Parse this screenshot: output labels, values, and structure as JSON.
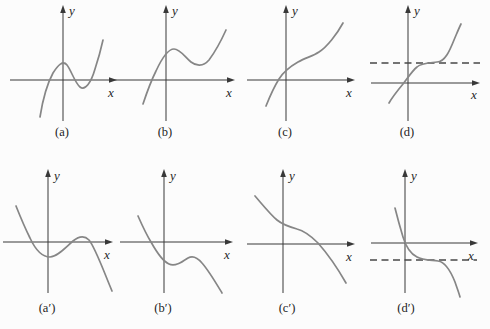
{
  "figure": {
    "background": "#fcfcfc",
    "curve_color": "#868686",
    "axis_color": "#383838",
    "dash_color": "#474747",
    "text_color": "#1f1f1f",
    "rows": 2,
    "cols": 4
  },
  "chart_data": [
    {
      "id": "a",
      "type": "line",
      "caption": "(a)",
      "xlabel": "x",
      "ylabel": "y",
      "features": "Cubic-shaped curve rising from lower left, crossing the x-axis left of the origin, with a local maximum above the x-axis just left of the y-axis and a local minimum below the x-axis right of the y-axis, then rising steeply.",
      "axes": {
        "x_axis_y": 80,
        "x_start": 10,
        "x_end": 117,
        "y_axis_x": 63,
        "y_top": 5,
        "y_bottom": 121
      },
      "curve_path": "M 40 117 C 43 98 47 84 53 73 C 58 65 63 60 67 65 C 71 70 75 83 80 87 C 85 91 91 83 95 69 C 98 60 101 49 103 40",
      "dashed_line": null,
      "labels": {
        "x_pos": [
          111,
          97
        ],
        "y_pos": [
          72,
          15
        ],
        "caption_pos": [
          62,
          136
        ]
      }
    },
    {
      "id": "b",
      "type": "line",
      "caption": "(b)",
      "xlabel": "x",
      "ylabel": "y",
      "features": "Cubic-shaped curve shifted upward: rises from lower left crossing the x-axis once left of the origin; both the local maximum and local minimum lie above the x-axis, then the curve rises steeply.",
      "axes": {
        "x_axis_y": 80,
        "x_start": 113,
        "x_end": 235,
        "y_axis_x": 166,
        "y_top": 5,
        "y_bottom": 121
      },
      "curve_path": "M 143 104 C 147 92 151 81 156 71 C 162 58 168 49 174 49 C 180 49 185 57 191 62 C 196 66 203 67 209 60 C 215 52 221 41 226 30",
      "dashed_line": null,
      "labels": {
        "x_pos": [
          229,
          97
        ],
        "y_pos": [
          175,
          15
        ],
        "caption_pos": [
          165,
          136
        ]
      }
    },
    {
      "id": "c",
      "type": "line",
      "caption": "(c)",
      "xlabel": "x",
      "ylabel": "y",
      "features": "Monotonically increasing S-shaped curve crossing the x-axis just left of the origin, flattening (inflection) above the x-axis to the right of the y-axis, then rising steeply.",
      "axes": {
        "x_axis_y": 80,
        "x_start": 247,
        "x_end": 355,
        "y_axis_x": 286,
        "y_top": 5,
        "y_bottom": 121
      },
      "curve_path": "M 266 106 C 270 96 274 87 279 79 C 284 71 291 66 298 62 C 305 58 313 56 319 52 C 327 47 337 34 343 23",
      "dashed_line": null,
      "labels": {
        "x_pos": [
          349,
          97
        ],
        "y_pos": [
          295,
          15
        ],
        "caption_pos": [
          285,
          136
        ]
      }
    },
    {
      "id": "d",
      "type": "line",
      "caption": "(d)",
      "xlabel": "x",
      "ylabel": "y",
      "features": "Increasing curve passing through the origin, leveling off along a horizontal dashed line above the x-axis, then rising steeply above it.",
      "axes": {
        "x_axis_y": 83,
        "x_start": 371,
        "x_end": 480,
        "y_axis_x": 408,
        "y_top": 5,
        "y_bottom": 121
      },
      "curve_path": "M 389 103 C 393 96 398 90 403 84 C 407 79 412 71 417 67 C 421 63 429 63 437 62 C 445 62 450 50 454 40 C 457 33 459 28 461 24",
      "dashed_line": {
        "y": 63,
        "x_start": 370,
        "x_end": 480
      },
      "labels": {
        "x_pos": [
          474,
          99
        ],
        "y_pos": [
          417,
          15
        ],
        "caption_pos": [
          407,
          136
        ]
      }
    },
    {
      "id": "a-prime",
      "type": "line",
      "caption": "(a′)",
      "xlabel": "x",
      "ylabel": "y",
      "features": "Mirror of (a): falls from upper left crossing the x-axis left of the origin, local minimum below the x-axis near the y-axis, local maximum slightly above the x-axis right of the y-axis, then falls steeply.",
      "axes": {
        "x_axis_y": 242,
        "x_start": 3,
        "x_end": 113,
        "y_axis_x": 48,
        "y_top": 169,
        "y_bottom": 293
      },
      "curve_path": "M 16 206 C 20 216 25 228 30 238 C 36 251 43 257 50 257 C 57 257 65 248 73 241 C 78 237 84 235 89 240 C 95 247 104 272 112 291",
      "dashed_line": null,
      "labels": {
        "x_pos": [
          107,
          259
        ],
        "y_pos": [
          57,
          180
        ],
        "caption_pos": [
          47,
          312
        ]
      }
    },
    {
      "id": "b-prime",
      "type": "line",
      "caption": "(b′)",
      "xlabel": "x",
      "ylabel": "y",
      "features": "Mirror of (b): falls from upper left crossing the x-axis once left of the origin; both the local minimum and local maximum lie below the x-axis, then the curve falls steeply.",
      "axes": {
        "x_axis_y": 242,
        "x_start": 120,
        "x_end": 233,
        "y_axis_x": 164,
        "y_top": 169,
        "y_bottom": 293
      },
      "curve_path": "M 138 216 C 142 225 146 234 151 242 C 156 251 162 261 169 264 C 175 267 182 262 188 258 C 193 255 197 257 202 263 C 209 271 216 283 222 293",
      "dashed_line": null,
      "labels": {
        "x_pos": [
          227,
          259
        ],
        "y_pos": [
          173,
          180
        ],
        "caption_pos": [
          163,
          312
        ]
      }
    },
    {
      "id": "c-prime",
      "type": "line",
      "caption": "(c′)",
      "xlabel": "x",
      "ylabel": "y",
      "features": "Monotonically decreasing S-shaped curve: falls from upper left, flattens (inflection) above the x-axis near the y-axis, crosses the x-axis right of the origin, then falls steeply.",
      "axes": {
        "x_axis_y": 244,
        "x_start": 247,
        "x_end": 355,
        "y_axis_x": 283,
        "y_top": 169,
        "y_bottom": 293
      },
      "curve_path": "M 255 196 C 262 204 270 214 277 220 C 283 225 290 227 297 229 C 305 231 311 236 318 243 C 326 252 338 269 346 283",
      "dashed_line": null,
      "labels": {
        "x_pos": [
          349,
          261
        ],
        "y_pos": [
          292,
          180
        ],
        "caption_pos": [
          287,
          312
        ]
      }
    },
    {
      "id": "d-prime",
      "type": "line",
      "caption": "(d′)",
      "xlabel": "x",
      "ylabel": "y",
      "features": "Decreasing curve passing near the origin, leveling off along a horizontal dashed line below the x-axis, then falling steeply below it.",
      "axes": {
        "x_axis_y": 243,
        "x_start": 371,
        "x_end": 478,
        "y_axis_x": 405,
        "y_top": 169,
        "y_bottom": 293
      },
      "curve_path": "M 395 208 C 397 216 400 227 403 237 C 406 247 411 254 417 257 C 422 260 430 260 438 261 C 446 262 451 272 455 282 C 457 288 459 293 460 297",
      "dashed_line": {
        "y": 260,
        "x_start": 370,
        "x_end": 477
      },
      "labels": {
        "x_pos": [
          471,
          260
        ],
        "y_pos": [
          414,
          180
        ],
        "caption_pos": [
          406,
          312
        ]
      }
    }
  ]
}
